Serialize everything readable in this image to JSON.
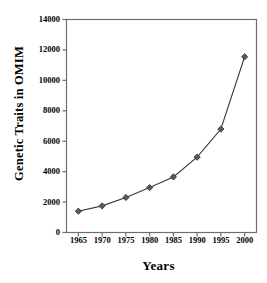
{
  "chart_data": {
    "type": "line",
    "title": "",
    "xlabel": "Years",
    "ylabel": "Genetic Traits in OMIM",
    "x": [
      1965,
      1970,
      1975,
      1980,
      1985,
      1990,
      1995,
      2000
    ],
    "values": [
      1400,
      1750,
      2300,
      2950,
      3650,
      4950,
      6800,
      11550
    ],
    "series": [
      {
        "name": "Genetic Traits in OMIM",
        "values": [
          1400,
          1750,
          2300,
          2950,
          3650,
          4950,
          6800,
          11550
        ]
      }
    ],
    "xlim": [
      1962.5,
      2002.5
    ],
    "ylim": [
      0,
      14000
    ],
    "ytick_labels": [
      "0",
      "2000",
      "4000",
      "6000",
      "8000",
      "10000",
      "12000",
      "14000"
    ],
    "ytick_values": [
      0,
      2000,
      4000,
      6000,
      8000,
      10000,
      12000,
      14000
    ],
    "xtick_labels": [
      "1965",
      "1970",
      "1975",
      "1980",
      "1985",
      "1990",
      "1995",
      "2000"
    ],
    "xtick_values": [
      1965,
      1970,
      1975,
      1980,
      1985,
      1990,
      1995,
      2000
    ],
    "grid": false,
    "legend": false,
    "marker": "diamond",
    "line_color": "#3a3a3a",
    "marker_color": "#5a5a5a",
    "axis_color": "#6e6e6e",
    "background": "#ffffff"
  }
}
